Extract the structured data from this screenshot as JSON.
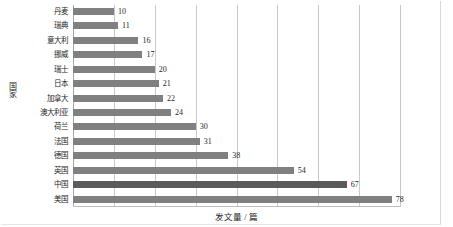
{
  "chart_data": {
    "type": "bar",
    "orientation": "horizontal",
    "title": "",
    "xlabel": "发文量 / 篇",
    "ylabel": "国家",
    "xlim": [
      0,
      80
    ],
    "ylim": null,
    "grid": true,
    "grid_axis": "x",
    "legend": null,
    "xticks": [
      0,
      10,
      20,
      30,
      40,
      50,
      60,
      70,
      80
    ],
    "xtick_labels": [
      "",
      "",
      "",
      "",
      "",
      "",
      "",
      "",
      ""
    ],
    "categories": [
      "丹麦",
      "瑞典",
      "意大利",
      "挪威",
      "瑞士",
      "日本",
      "加拿大",
      "澳大利亚",
      "荷兰",
      "法国",
      "德国",
      "英国",
      "中国",
      "美国"
    ],
    "values": [
      10,
      11,
      16,
      17,
      20,
      21,
      22,
      24,
      30,
      31,
      38,
      54,
      67,
      78
    ],
    "value_labels": [
      "10",
      "11",
      "16",
      "17",
      "20",
      "21",
      "22",
      "24",
      "30",
      "31",
      "38",
      "54",
      "67",
      "78"
    ],
    "highlight_index": 12,
    "colors": {
      "bar": "#808080",
      "bar_highlight": "#5a5a5a",
      "gridline": "#c9c9c9",
      "axis": "#a6a6a6",
      "text": "#262626",
      "background": "#ffffff"
    }
  }
}
